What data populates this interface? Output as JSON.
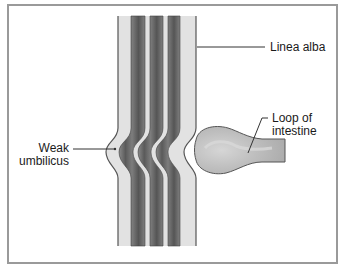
{
  "figure": {
    "labels": {
      "linea_alba": "Linea alba",
      "loop_line1": "Loop of",
      "loop_line2": "intestine",
      "weak_line1": "Weak",
      "weak_line2": "umbilicus"
    },
    "colors": {
      "frame": "#9a9a9a",
      "light_band": "#e2e2e2",
      "dark_band": "#6e6e6e",
      "outline": "#555555",
      "intestine": "#bdbdbd",
      "text": "#1a1a1a"
    }
  }
}
